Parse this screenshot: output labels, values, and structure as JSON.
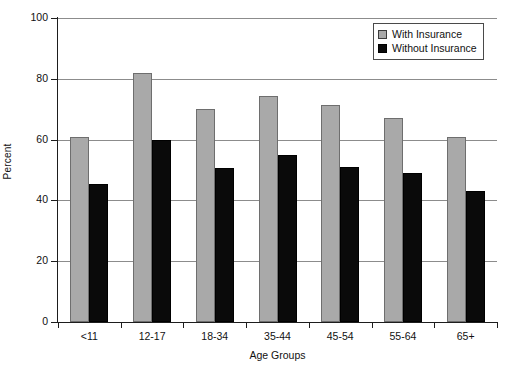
{
  "chart_data": {
    "type": "bar",
    "title": "",
    "subtitle": "",
    "xlabel": "Age Groups",
    "ylabel": "Percent",
    "categories": [
      "<11",
      "12-17",
      "18-34",
      "35-44",
      "45-54",
      "55-64",
      "65+"
    ],
    "series": [
      {
        "name": "With Insurance",
        "color": "#a9a9a9",
        "values": [
          61,
          82,
          70,
          74.5,
          71.5,
          67,
          61
        ]
      },
      {
        "name": "Without Insurance",
        "color": "#0a0a0a",
        "values": [
          45.5,
          60,
          50.5,
          55,
          51,
          49,
          43
        ]
      }
    ],
    "ylim": [
      0,
      100
    ],
    "yticks": [
      0,
      20,
      40,
      60,
      80,
      100
    ],
    "ytick_labels": [
      "0",
      "20",
      "40",
      "60",
      "80",
      "100"
    ],
    "grid": "horizontal",
    "legend_position": "top-right",
    "annotations": []
  },
  "legend": {
    "entries": [
      {
        "label": "With Insurance"
      },
      {
        "label": "Without Insurance"
      }
    ]
  }
}
